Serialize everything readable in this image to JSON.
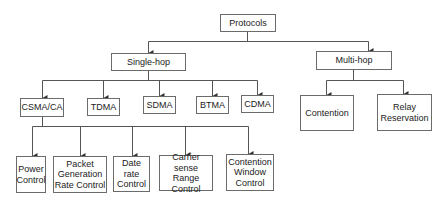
{
  "diagram": {
    "type": "tree",
    "root": {
      "label": "Protocols",
      "children": [
        {
          "label": "Single-hop",
          "children": [
            {
              "label": "CSMA/CA",
              "children": [
                {
                  "label": "Power\nControl"
                },
                {
                  "label": "Packet\nGeneration\nRate Control"
                },
                {
                  "label": "Date rate\nControl"
                },
                {
                  "label": "Carrier sense\nRange\nControl"
                },
                {
                  "label": "Contention\nWindow\nControl"
                }
              ]
            },
            {
              "label": "TDMA"
            },
            {
              "label": "SDMA"
            },
            {
              "label": "BTMA"
            },
            {
              "label": "CDMA"
            }
          ]
        },
        {
          "label": "Multi-hop",
          "children": [
            {
              "label": "Contention"
            },
            {
              "label": "Relay\nReservation"
            }
          ]
        }
      ]
    }
  },
  "nodes": {
    "protocols": "Protocols",
    "single_hop": "Single-hop",
    "multi_hop": "Multi-hop",
    "csma_ca": "CSMA/CA",
    "tdma": "TDMA",
    "sdma": "SDMA",
    "btma": "BTMA",
    "cdma": "CDMA",
    "contention": "Contention",
    "relay_reservation": "Relay\nReservation",
    "power_control": "Power\nControl",
    "packet_generation": "Packet\nGeneration\nRate Control",
    "date_rate": "Date rate\nControl",
    "carrier_sense": "Carrier sense\nRange\nControl",
    "contention_window": "Contention\nWindow\nControl"
  },
  "colors": {
    "line": "#444444",
    "border": "#6b6b6b",
    "text": "#222222"
  }
}
